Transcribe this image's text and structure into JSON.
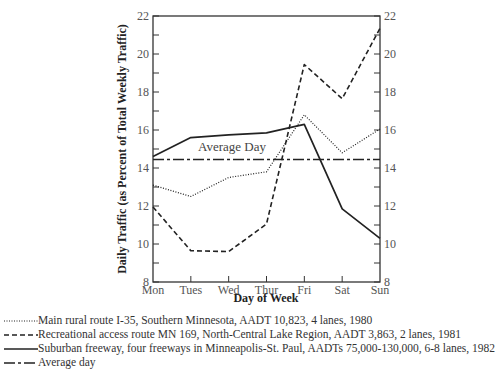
{
  "chart_data": {
    "type": "line",
    "title": "",
    "xlabel": "Day of Week",
    "ylabel": "Daily Traffic (as Percent of Total Weekly Traffic)",
    "categories": [
      "Mon",
      "Tues",
      "Wed",
      "Thur",
      "Fri",
      "Sat",
      "Sun"
    ],
    "ylim": [
      8,
      22
    ],
    "yticks": [
      8,
      10,
      12,
      14,
      16,
      18,
      20,
      22
    ],
    "y_axis_both_sides": true,
    "grid": false,
    "legend_position": "bottom",
    "series": [
      {
        "name": "Main rural route I-35, Southern Minnesota, AADT 10,823, 4 lanes, 1980",
        "style": "dotted",
        "values": [
          13.1,
          12.5,
          13.5,
          13.8,
          16.8,
          14.8,
          16.05
        ]
      },
      {
        "name": "Recreational access route MN 169, North-Central Lake Region, AADT 3,863, 2 lanes, 1981",
        "style": "dashed",
        "values": [
          11.95,
          9.65,
          9.6,
          11.05,
          19.45,
          17.65,
          21.35
        ]
      },
      {
        "name": "Suburban freeway, four freeways in Minneapolis-St. Paul, AADTs 75,000-130,000, 6-8 lanes, 1982",
        "style": "solid",
        "values": [
          14.6,
          15.6,
          15.75,
          15.85,
          16.3,
          11.85,
          10.3
        ]
      },
      {
        "name": "Average day",
        "style": "dash-dot",
        "values": [
          14.45,
          14.45,
          14.45,
          14.45,
          14.45,
          14.45,
          14.45
        ]
      }
    ],
    "annotations": [
      {
        "text": "Average Day",
        "x": "Tues",
        "y": 14.7
      }
    ]
  },
  "labels": {
    "xlabel": "Day of Week",
    "ylabel": "Daily Traffic (as Percent of Total Weekly Traffic)",
    "average_annotation": "Average Day"
  },
  "legend": [
    {
      "label": "Main rural route I-35, Southern Minnesota, AADT 10,823, 4 lanes, 1980",
      "style": "dotted"
    },
    {
      "label": "Recreational access route MN 169, North-Central Lake Region, AADT 3,863, 2 lanes, 1981",
      "style": "dashed"
    },
    {
      "label": "Suburban freeway, four freeways in Minneapolis-St. Paul, AADTs 75,000-130,000, 6-8 lanes, 1982",
      "style": "solid"
    },
    {
      "label": "Average day",
      "style": "dash-dot"
    }
  ],
  "colors": {
    "line": "#222222",
    "axis": "#333333",
    "text": "#444444"
  }
}
